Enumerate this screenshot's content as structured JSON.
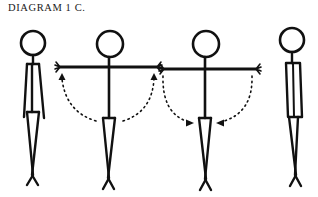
{
  "diagram": {
    "title": "DIAGRAM 1 C.",
    "ink_color": "#111111",
    "background": "#ffffff",
    "figures": [
      {
        "id": "figure-1",
        "pose": "standing-arms-at-sides",
        "view": "front"
      },
      {
        "id": "figure-2",
        "pose": "arms-raised-sideways",
        "view": "front",
        "motion": "arms-up",
        "arrow_direction": "up"
      },
      {
        "id": "figure-3",
        "pose": "arms-lowering-sideways",
        "view": "front",
        "motion": "arms-down",
        "arrow_direction": "inward-down"
      },
      {
        "id": "figure-4",
        "pose": "standing-arms-at-sides",
        "view": "side"
      }
    ]
  }
}
